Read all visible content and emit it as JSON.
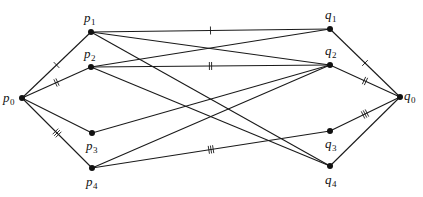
{
  "diagram": {
    "type": "graph",
    "nodes": [
      {
        "id": "p0",
        "base": "p",
        "sub": "0",
        "x": 22,
        "y": 98,
        "lx": 3,
        "ly": 102
      },
      {
        "id": "p1",
        "base": "p",
        "sub": "1",
        "x": 91,
        "y": 32,
        "lx": 84,
        "ly": 22
      },
      {
        "id": "p2",
        "base": "p",
        "sub": "2",
        "x": 91,
        "y": 67,
        "lx": 84,
        "ly": 58
      },
      {
        "id": "p3",
        "base": "p",
        "sub": "3",
        "x": 92,
        "y": 133,
        "lx": 86,
        "ly": 150
      },
      {
        "id": "p4",
        "base": "p",
        "sub": "4",
        "x": 92,
        "y": 168,
        "lx": 86,
        "ly": 186
      },
      {
        "id": "q1",
        "base": "q",
        "sub": "1",
        "x": 330,
        "y": 29,
        "lx": 325,
        "ly": 19
      },
      {
        "id": "q2",
        "base": "q",
        "sub": "2",
        "x": 330,
        "y": 65,
        "lx": 325,
        "ly": 55
      },
      {
        "id": "q0",
        "base": "q",
        "sub": "0",
        "x": 400,
        "y": 97,
        "lx": 404,
        "ly": 100
      },
      {
        "id": "q3",
        "base": "q",
        "sub": "3",
        "x": 330,
        "y": 131,
        "lx": 325,
        "ly": 148
      },
      {
        "id": "q4",
        "base": "q",
        "sub": "4",
        "x": 330,
        "y": 166,
        "lx": 325,
        "ly": 184
      }
    ],
    "edges": [
      {
        "from": "p0",
        "to": "p1",
        "ticks": 1
      },
      {
        "from": "p0",
        "to": "p2",
        "ticks": 2
      },
      {
        "from": "p0",
        "to": "p3",
        "ticks": 0
      },
      {
        "from": "p0",
        "to": "p4",
        "ticks": 3
      },
      {
        "from": "p1",
        "to": "q1",
        "ticks": 1
      },
      {
        "from": "p1",
        "to": "q2",
        "ticks": 0
      },
      {
        "from": "p1",
        "to": "q4",
        "ticks": 0
      },
      {
        "from": "p2",
        "to": "q1",
        "ticks": 0
      },
      {
        "from": "p2",
        "to": "q2",
        "ticks": 2
      },
      {
        "from": "p2",
        "to": "q4",
        "ticks": 0
      },
      {
        "from": "p3",
        "to": "q2",
        "ticks": 0
      },
      {
        "from": "p4",
        "to": "q2",
        "ticks": 0
      },
      {
        "from": "p4",
        "to": "q3",
        "ticks": 3
      },
      {
        "from": "q1",
        "to": "q0",
        "ticks": 1
      },
      {
        "from": "q2",
        "to": "q0",
        "ticks": 2
      },
      {
        "from": "q3",
        "to": "q0",
        "ticks": 3
      },
      {
        "from": "q4",
        "to": "q0",
        "ticks": 0
      }
    ],
    "colors": {
      "stroke": "#1a1a1a",
      "node": "#111111",
      "background": "#ffffff"
    }
  }
}
